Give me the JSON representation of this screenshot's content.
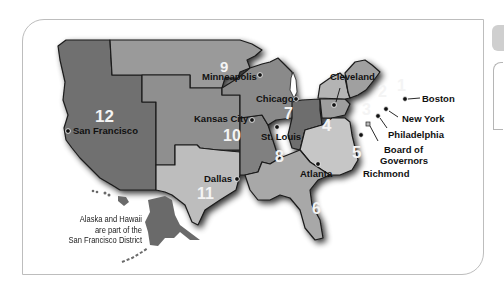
{
  "map": {
    "title": "Federal Reserve Districts",
    "districts": [
      {
        "number": "1",
        "city": "Boston"
      },
      {
        "number": "2",
        "city": "New York"
      },
      {
        "number": "3",
        "city": "Philadelphia"
      },
      {
        "number": "4",
        "city": "Cleveland"
      },
      {
        "number": "5",
        "city": "Richmond"
      },
      {
        "number": "6",
        "city": "Atlanta"
      },
      {
        "number": "7",
        "city": "Chicago"
      },
      {
        "number": "8",
        "city": "St. Louis"
      },
      {
        "number": "9",
        "city": "Minneapolis"
      },
      {
        "number": "10",
        "city": "Kansas City"
      },
      {
        "number": "11",
        "city": "Dallas"
      },
      {
        "number": "12",
        "city": "San Francisco"
      }
    ],
    "board_label_line1": "Board of",
    "board_label_line2": "Governors",
    "note_line1": "Alaska and Hawaii",
    "note_line2": "are part of the",
    "note_line3": "San Francisco District",
    "colors": {
      "d12": "#707070",
      "d9": "#9a9a9a",
      "d10": "#8f8f8f",
      "d11": "#bdbdbd",
      "d8": "#808080",
      "d7": "#8a8a8a",
      "d6": "#a8a8a8",
      "d5": "#c6c6c6",
      "d4": "#6e6e6e",
      "d3": "#9d9d9d",
      "d2": "#b4b4b4",
      "d1": "#a0a0a0"
    }
  }
}
